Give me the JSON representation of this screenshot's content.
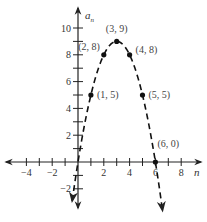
{
  "chart_data": {
    "type": "scatter",
    "title": "",
    "xlabel": "n",
    "ylabel": "a_n",
    "xlim": [
      -5.6,
      9.4
    ],
    "ylim": [
      -3.2,
      11.4
    ],
    "grid": false,
    "x_ticks": [
      -4,
      -3,
      -2,
      -1,
      0,
      1,
      2,
      3,
      4,
      5,
      6,
      7,
      8
    ],
    "x_tick_labels": [
      "-4",
      "-2",
      "2",
      "4",
      "6",
      "8"
    ],
    "x_tick_label_values": [
      -4,
      -2,
      2,
      4,
      6,
      8
    ],
    "y_ticks": [
      -2,
      -1,
      1,
      2,
      3,
      4,
      5,
      6,
      7,
      8,
      9,
      10
    ],
    "y_tick_labels": [
      "-2",
      "2",
      "4",
      "6",
      "8",
      "10"
    ],
    "y_tick_label_values": [
      -2,
      2,
      4,
      6,
      8,
      10
    ],
    "series": [
      {
        "name": "points",
        "points": [
          {
            "x": 1,
            "y": 5,
            "label": "(1, 5)"
          },
          {
            "x": 2,
            "y": 8,
            "label": "(2, 8)"
          },
          {
            "x": 3,
            "y": 9,
            "label": "(3, 9)"
          },
          {
            "x": 4,
            "y": 8,
            "label": "(4, 8)"
          },
          {
            "x": 5,
            "y": 5,
            "label": "(5, 5)"
          },
          {
            "x": 6,
            "y": 0,
            "label": "(6, 0)"
          }
        ]
      },
      {
        "name": "dashed parabola a_n = -n^2 + 6n",
        "style": "dashed",
        "x_range": [
          -0.45,
          6.55
        ]
      }
    ]
  },
  "labels": {
    "x_axis": "n",
    "y_axis_main": "a",
    "y_axis_sub": "n"
  }
}
